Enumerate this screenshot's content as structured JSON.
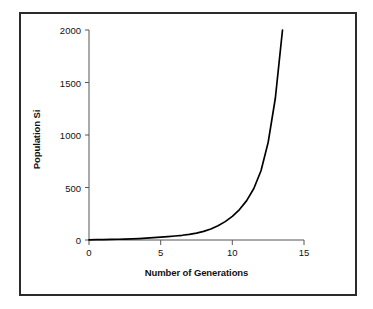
{
  "chart_data": {
    "type": "line",
    "title": "",
    "xlabel": "Number of Generations",
    "ylabel": "Population Si",
    "xlim": [
      0,
      15
    ],
    "ylim": [
      0,
      2000
    ],
    "xticks": [
      0,
      5,
      10,
      15
    ],
    "xtick_labels": [
      "0",
      "5",
      "10",
      "15"
    ],
    "yticks": [
      0,
      500,
      1000,
      1500,
      2000
    ],
    "ytick_labels": [
      "0",
      "500",
      "1000",
      "1500",
      "2000"
    ],
    "grid": false,
    "legend": null,
    "series": [
      {
        "name": "Population growth",
        "color": "#000000",
        "x": [
          0,
          0.5,
          1,
          1.5,
          2,
          2.5,
          3,
          3.5,
          4,
          4.5,
          5,
          5.5,
          6,
          6.5,
          7,
          7.5,
          8,
          8.5,
          9,
          9.5,
          10,
          10.5,
          11,
          11.5,
          12,
          12.5,
          13,
          13.5
        ],
        "y": [
          2,
          3,
          4,
          5,
          7,
          9,
          11,
          14,
          18,
          22,
          27,
          32,
          38,
          45,
          54,
          66,
          82,
          105,
          135,
          175,
          225,
          290,
          375,
          490,
          660,
          930,
          1350,
          2000
        ]
      }
    ]
  },
  "axes": {
    "axis_line_color": "#2b2b2b",
    "frame_color": "#2b2b2b",
    "background": "#ffffff"
  }
}
